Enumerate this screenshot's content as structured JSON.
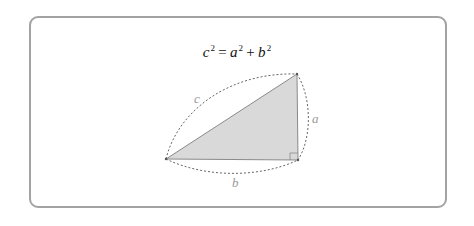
{
  "formula": {
    "text": "c² = a² + b²",
    "c": "c",
    "a": "a",
    "b": "b",
    "exp": "2",
    "equals": "=",
    "plus": "+"
  },
  "diagram": {
    "type": "right-triangle",
    "labels": {
      "hypotenuse": "c",
      "vertical_leg": "a",
      "horizontal_leg": "b"
    },
    "fill_color": "#d9d9d9",
    "stroke_color": "#888888",
    "dashed_arc_color": "#666666",
    "label_color": "#9a9a9a",
    "frame_border_color": "#a3a3a3"
  }
}
